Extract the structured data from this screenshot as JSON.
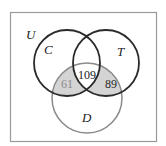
{
  "diagram": {
    "type": "venn",
    "universe_label": "U",
    "sets": [
      {
        "id": "C",
        "label": "C",
        "stroke": "#2a2a2a"
      },
      {
        "id": "T",
        "label": "T",
        "stroke": "#2a2a2a"
      },
      {
        "id": "D",
        "label": "D",
        "stroke": "#8a8a8a"
      }
    ],
    "regions": [
      {
        "sets": [
          "C",
          "T",
          "D"
        ],
        "value": "109",
        "color": "#1a1a1a"
      },
      {
        "sets": [
          "C",
          "D"
        ],
        "value": "61",
        "color": "#8a8a8a",
        "shaded": true
      },
      {
        "sets": [
          "T",
          "D"
        ],
        "value": "89",
        "color": "#2a2a2a",
        "shaded": true
      }
    ],
    "shade_color": "#d4d4d4",
    "frame_color": "#9a9a9a"
  }
}
